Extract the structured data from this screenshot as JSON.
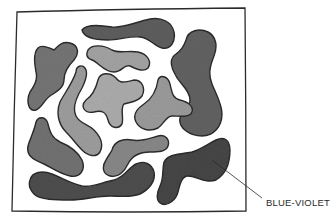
{
  "illustration": {
    "description": "Hand-drawn square frame containing concentric rings of irregular watercolor blobs, shading from light in the center to dark at the outer edge",
    "frame": {
      "x": 16,
      "y": 10,
      "width": 230,
      "height": 202
    },
    "shades": {
      "center": "#a8a8a8",
      "inner_ring": "#9a9a9a",
      "middle_ring": "#7c7c7c",
      "outer_ring": "#5a5a5a",
      "darkest": "#3e3e3e"
    },
    "callout": {
      "label": "BLUE-VIOLET",
      "points_to": "bottom-right dark blob"
    }
  }
}
